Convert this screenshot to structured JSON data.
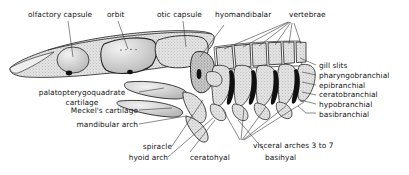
{
  "figure": {
    "style": "stippled pen-and-ink anatomical line drawing",
    "background_color": "#ffffff",
    "ink_color": "#141414",
    "cartilage_fill": "#d8d8d8",
    "gill_slit_color": "#101010",
    "leader_line_color": "#2a2a2a"
  },
  "labels": {
    "olfactory_capsule": "olfactory capsule",
    "orbit": "orbit",
    "otic_capsule": "otic capsule",
    "hyomandibalar": "hyomandibalar",
    "vertebrae": "vertebrae",
    "gill_slits": "gill slits",
    "pharyngobranchial": "pharyngobranchial",
    "epibranchial": "epibranchial",
    "ceratobranchial": "ceratobranchial",
    "hypobranchial": "hypobranchial",
    "basibranchial": "basibranchial",
    "palatopterygoquadrate_line1": "palatopterygoquadrate",
    "palatopterygoquadrate_line2": "cartilage",
    "meckels_cartilage": "Meckel's cartilage",
    "mandibular_arch": "mandibular arch",
    "spiracle": "spiracle",
    "hyoid_arch": "hyoid arch",
    "ceratohyal": "ceratohyal",
    "basihyal": "basihyal",
    "visceral_arches": "visceral arches 3 to 7"
  }
}
